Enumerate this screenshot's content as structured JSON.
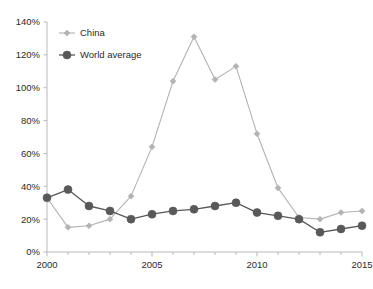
{
  "chart_data": {
    "type": "line",
    "title": "",
    "xlabel": "",
    "ylabel": "",
    "x": [
      2000,
      2001,
      2002,
      2003,
      2004,
      2005,
      2006,
      2007,
      2008,
      2009,
      2010,
      2011,
      2012,
      2013,
      2014,
      2015
    ],
    "xlim": [
      2000,
      2015
    ],
    "ylim": [
      0,
      140
    ],
    "ytick_values": [
      0,
      20,
      40,
      60,
      80,
      100,
      120,
      140
    ],
    "ytick_labels": [
      "0%",
      "20%",
      "40%",
      "60%",
      "80%",
      "100%",
      "120%",
      "140%"
    ],
    "xtick_values": [
      2000,
      2005,
      2010,
      2015
    ],
    "xtick_labels": [
      "2000",
      "2005",
      "2010",
      "2015"
    ],
    "xminor_ticks": [
      2001,
      2002,
      2003,
      2004,
      2006,
      2007,
      2008,
      2009,
      2011,
      2012,
      2013,
      2014
    ],
    "grid": false,
    "legend_position": "top-left-inside",
    "series": [
      {
        "name": "China",
        "color": "#b3b3b3",
        "marker": "diamond",
        "marker_size": 3,
        "values": [
          33,
          15,
          16,
          20,
          34,
          64,
          104,
          131,
          105,
          113,
          72,
          39,
          21,
          20,
          24,
          25
        ]
      },
      {
        "name": "World average",
        "color": "#595959",
        "marker": "circle",
        "marker_size": 4,
        "values": [
          33,
          38,
          28,
          25,
          20,
          23,
          25,
          26,
          28,
          30,
          24,
          22,
          20,
          12,
          14,
          16
        ]
      }
    ]
  },
  "legend": {
    "items": [
      {
        "label": "China"
      },
      {
        "label": "World average"
      }
    ]
  }
}
